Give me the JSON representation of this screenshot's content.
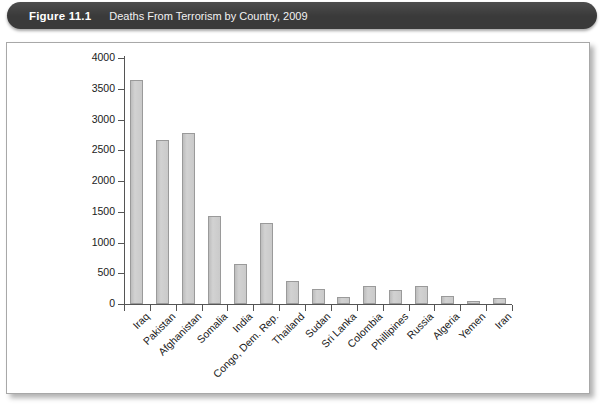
{
  "figure": {
    "number_label": "Figure 11.1",
    "caption": "Deaths From Terrorism by Country, 2009"
  },
  "colors": {
    "title_bar_bg": "#3a3a3a",
    "title_text": "#ffffff",
    "panel_border": "#a8a8a8",
    "bar_fill": "#c9c9c9",
    "bar_stroke": "#9a9a9a",
    "axis": "#555555"
  },
  "chart_data": {
    "type": "bar",
    "title": "Deaths From Terrorism by Country, 2009",
    "xlabel": "",
    "ylabel": "",
    "ylim": [
      0,
      4000
    ],
    "ytick_step": 500,
    "ytick_labels": [
      "0",
      "500",
      "1000",
      "1500",
      "2000",
      "2500",
      "3000",
      "3500",
      "4000"
    ],
    "grid": false,
    "legend": false,
    "orientation": "vertical",
    "categories": [
      "Iraq",
      "Pakistan",
      "Afghanistan",
      "Somalia",
      "India",
      "Congo, Dem. Rep.",
      "Thailand",
      "Sudan",
      "Sri Lanka",
      "Colombia",
      "Phillipines",
      "Russia",
      "Algeria",
      "Yemen",
      "Iran"
    ],
    "values": [
      3650,
      2670,
      2780,
      1430,
      650,
      1320,
      380,
      250,
      110,
      300,
      220,
      290,
      130,
      55,
      105
    ]
  }
}
